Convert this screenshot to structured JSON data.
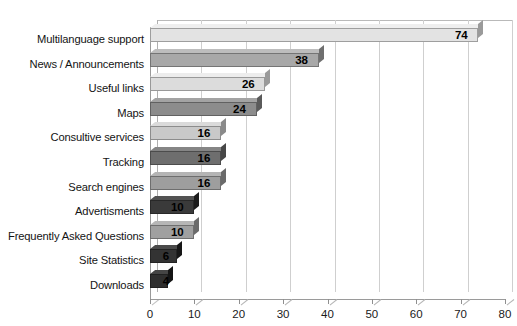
{
  "chart_data": {
    "type": "bar",
    "orientation": "horizontal",
    "title": "",
    "subtitle": "",
    "xlabel": "",
    "ylabel": "",
    "xlim": [
      0,
      80
    ],
    "xticks": [
      0,
      10,
      20,
      30,
      40,
      50,
      60,
      70,
      80
    ],
    "grid": true,
    "legend": false,
    "legend_position": "none",
    "categories": [
      "Multilanguage support",
      "News / Announcements",
      "Useful links",
      "Maps",
      "Consultive services",
      "Tracking",
      "Search engines",
      "Advertisments",
      "Frequently Asked Questions",
      "Site Statistics",
      "Downloads"
    ],
    "values": [
      74,
      38,
      26,
      24,
      16,
      16,
      16,
      10,
      10,
      6,
      4
    ],
    "value_labels": [
      "74",
      "38",
      "26",
      "24",
      "16",
      "16",
      "16",
      "10",
      "10",
      "6",
      "4"
    ],
    "bar_colors": [
      "#e3e3e3",
      "#a8a8a8",
      "#dcdcdc",
      "#8c8c8c",
      "#c9c9c9",
      "#6e6e6e",
      "#9e9e9e",
      "#3a3a3a",
      "#a0a0a0",
      "#333333",
      "#2e2e2e"
    ],
    "cap_colors": [
      "#9a9a9a",
      "#6f6f6f",
      "#9a9a9a",
      "#5a5a5a",
      "#8a8a8a",
      "#474747",
      "#6a6a6a",
      "#1c1c1c",
      "#6a6a6a",
      "#161616",
      "#141414"
    ],
    "top_colors": [
      "#eeeeee",
      "#bdbdbd",
      "#ededed",
      "#a3a3a3",
      "#dadada",
      "#858585",
      "#b4b4b4",
      "#525252",
      "#b6b6b6",
      "#4a4a4a",
      "#454545"
    ]
  },
  "style": {
    "background": "#ffffff",
    "gridline_color": "#cfcfcf",
    "axis_color": "#9a9a9a",
    "label_color": "#141414"
  }
}
